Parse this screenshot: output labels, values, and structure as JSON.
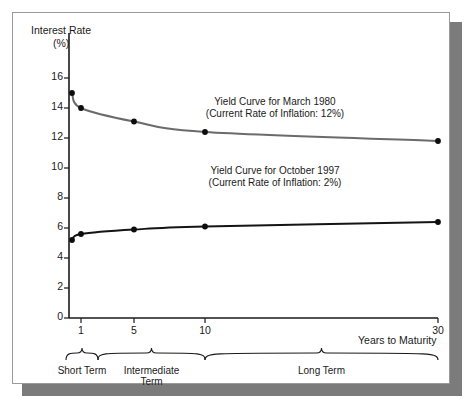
{
  "chart_data": {
    "type": "line",
    "title": "",
    "ylabel": "Interest Rate\n(%)",
    "ylabel_line1": "Interest Rate",
    "ylabel_line2": "(%)",
    "xlabel": "Years to Maturity",
    "ylim": [
      0,
      16
    ],
    "yticks": [
      0,
      2,
      4,
      6,
      8,
      10,
      12,
      14,
      16
    ],
    "ytick_labels": [
      "0",
      "2",
      "4",
      "6",
      "8",
      "10",
      "12",
      "14",
      "16"
    ],
    "xticks": [
      1,
      5,
      10,
      30
    ],
    "xtick_labels": [
      "1",
      "5",
      "10",
      "30"
    ],
    "grid": false,
    "legend_position": "inline-annotations",
    "axis_note": "x axis is compressed/non-linear: 1, 5, 10 and 30 are unevenly spaced",
    "series": [
      {
        "name": "Yield Curve for March 1980",
        "color": "#6b6b6b",
        "annotation_line1": "Yield Curve for March 1980",
        "annotation_line2": "(Current Rate of Inflation: 12%)",
        "x": [
          0.25,
          1,
          5,
          10,
          30
        ],
        "y": [
          15.0,
          14.0,
          13.1,
          12.4,
          11.8
        ],
        "markers": [
          {
            "x": 0.25,
            "y": 15.0
          },
          {
            "x": 1,
            "y": 14.0
          },
          {
            "x": 5,
            "y": 13.1
          },
          {
            "x": 10,
            "y": 12.4
          },
          {
            "x": 30,
            "y": 11.8
          }
        ]
      },
      {
        "name": "Yield Curve for October 1997",
        "color": "#141414",
        "annotation_line1": "Yield Curve for October 1997",
        "annotation_line2": "(Current Rate of Inflation: 2%)",
        "x": [
          0.25,
          1,
          5,
          10,
          30
        ],
        "y": [
          5.2,
          5.6,
          5.9,
          6.1,
          6.4
        ],
        "markers": [
          {
            "x": 0.25,
            "y": 5.2
          },
          {
            "x": 1,
            "y": 5.6
          },
          {
            "x": 5,
            "y": 5.9
          },
          {
            "x": 10,
            "y": 6.1
          },
          {
            "x": 30,
            "y": 6.4
          }
        ]
      }
    ],
    "annotations": [
      {
        "name": "march-1980-annotation",
        "line1": "Yield Curve for March 1980",
        "line2": "(Current Rate of Inflation: 12%)"
      },
      {
        "name": "october-1997-annotation",
        "line1": "Yield Curve for October 1997",
        "line2": "(Current Rate of Inflation: 2%)"
      }
    ],
    "maturity_brackets": [
      {
        "label": "Short Term",
        "label_line1": "Short Term",
        "label_line2": "",
        "from": 0,
        "to": 2
      },
      {
        "label": "Intermediate Term",
        "label_line1": "Intermediate",
        "label_line2": "Term",
        "from": 2,
        "to": 10
      },
      {
        "label": "Long Term",
        "label_line1": "Long Term",
        "label_line2": "",
        "from": 10,
        "to": 30
      }
    ],
    "colors": {
      "curve_1980": "#6b6b6b",
      "curve_1997": "#141414",
      "axis": "#1a1a1a",
      "frame": "#9a9a9a",
      "shadow": "#7b7b7b",
      "background": "#ffffff"
    }
  }
}
